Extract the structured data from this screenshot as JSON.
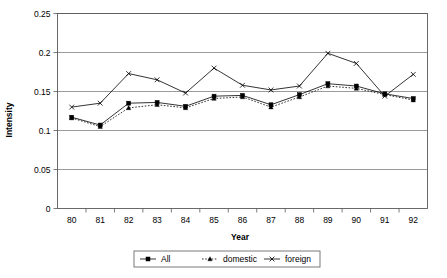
{
  "chart_data": {
    "type": "line",
    "title": "",
    "xlabel": "Year",
    "ylabel": "Intensity",
    "categories": [
      "80",
      "81",
      "82",
      "83",
      "84",
      "85",
      "86",
      "87",
      "88",
      "89",
      "90",
      "91",
      "92"
    ],
    "x": [
      80,
      81,
      82,
      83,
      84,
      85,
      86,
      87,
      88,
      89,
      90,
      91,
      92
    ],
    "ylim": [
      0,
      0.25
    ],
    "yticks": [
      0,
      0.05,
      0.1,
      0.15,
      0.2,
      0.25
    ],
    "ytick_labels": [
      "0",
      "0.05",
      "0.1",
      "0.15",
      "0.2",
      "0.25"
    ],
    "grid": true,
    "legend_position": "bottom",
    "series": [
      {
        "name": "All",
        "marker": "square",
        "line_style": "solid",
        "color": "#000000",
        "values": [
          0.117,
          0.107,
          0.135,
          0.136,
          0.131,
          0.144,
          0.145,
          0.133,
          0.146,
          0.16,
          0.157,
          0.147,
          0.141
        ]
      },
      {
        "name": "domestic",
        "marker": "triangle",
        "line_style": "dotted",
        "color": "#000000",
        "values": [
          0.116,
          0.105,
          0.129,
          0.133,
          0.129,
          0.141,
          0.143,
          0.13,
          0.143,
          0.157,
          0.154,
          0.146,
          0.139
        ]
      },
      {
        "name": "foreign",
        "marker": "cross",
        "line_style": "solid",
        "color": "#000000",
        "values": [
          0.13,
          0.135,
          0.173,
          0.165,
          0.148,
          0.18,
          0.158,
          0.152,
          0.157,
          0.199,
          0.186,
          0.144,
          0.172
        ]
      }
    ]
  },
  "legend": {
    "items": [
      {
        "label": "All"
      },
      {
        "label": "domestic"
      },
      {
        "label": "foreign"
      }
    ]
  },
  "axes": {
    "y_title": "Intensity",
    "x_title": "Year"
  }
}
